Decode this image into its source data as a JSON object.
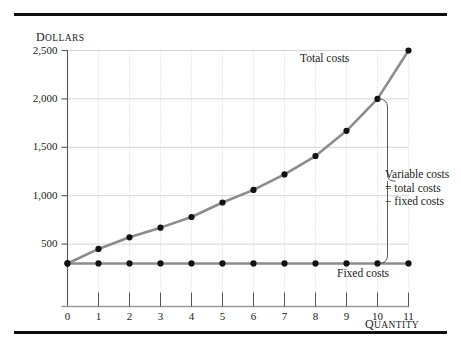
{
  "figure": {
    "rules": [
      "top-rule",
      "bottom-rule"
    ]
  },
  "chart_data": {
    "type": "line",
    "title": "",
    "xlabel": "Quantity",
    "ylabel": "Dollars",
    "xlim": [
      0,
      11
    ],
    "ylim": [
      0,
      2500
    ],
    "grid": true,
    "legend_position": "inline-annotations",
    "x": [
      0,
      1,
      2,
      3,
      4,
      5,
      6,
      7,
      8,
      9,
      10,
      11
    ],
    "xticks": [
      "0",
      "1",
      "2",
      "3",
      "4",
      "5",
      "6",
      "7",
      "8",
      "9",
      "10",
      "11"
    ],
    "yticks": [
      "500",
      "1,000",
      "1,500",
      "2,000",
      "2,500"
    ],
    "ytick_values": [
      500,
      1000,
      1500,
      2000,
      2500
    ],
    "series": [
      {
        "name": "Total costs",
        "color": "#8c8c8c",
        "marker_color": "#111111",
        "values": [
          300,
          450,
          570,
          670,
          780,
          930,
          1060,
          1220,
          1410,
          1670,
          2000,
          2500
        ]
      },
      {
        "name": "Fixed costs",
        "color": "#8c8c8c",
        "marker_color": "#111111",
        "values": [
          300,
          300,
          300,
          300,
          300,
          300,
          300,
          300,
          300,
          300,
          300,
          300
        ]
      }
    ],
    "annotations": [
      {
        "name": "variable-costs-bracket",
        "lines": [
          "Variable costs",
          "= total costs",
          "− fixed costs"
        ],
        "at_x": 10,
        "from_y": 300,
        "to_y": 2000
      },
      {
        "name": "total-costs-label",
        "text": "Total costs"
      },
      {
        "name": "fixed-costs-label",
        "text": "Fixed costs"
      }
    ]
  },
  "labels": {
    "y_axis_title_first": "D",
    "y_axis_title_rest": "OLLARS",
    "x_axis_title_first": "Q",
    "x_axis_title_rest": "UANTITY",
    "total_costs": "Total costs",
    "fixed_costs": "Fixed costs",
    "variable_line1": "Variable costs",
    "variable_line2": "= total costs",
    "variable_line3": "− fixed costs"
  },
  "ytick_labels": [
    "2,500",
    "2,000",
    "1,500",
    "1,000",
    "500"
  ],
  "xtick_labels": [
    "0",
    "1",
    "2",
    "3",
    "4",
    "5",
    "6",
    "7",
    "8",
    "9",
    "10",
    "11"
  ],
  "colors": {
    "line": "#8c8c8c",
    "marker": "#111111",
    "grid": "#c9c9c9",
    "axis": "#6f6f6f",
    "rule": "#0d0d0d"
  }
}
